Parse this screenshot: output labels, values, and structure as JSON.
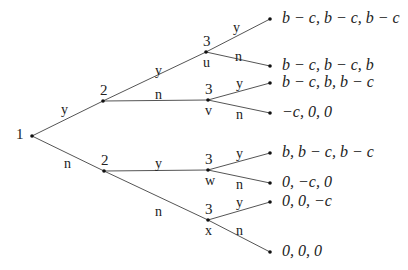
{
  "diagram": {
    "type": "game-tree",
    "colors": {
      "line": "#555555",
      "node": "#111111",
      "text": "#222222"
    },
    "nodes": [
      {
        "id": "root",
        "player": "1",
        "x": 32,
        "y": 136
      },
      {
        "id": "p2-top",
        "player": "2",
        "x": 103,
        "y": 101
      },
      {
        "id": "p2-bot",
        "player": "2",
        "x": 104,
        "y": 171
      },
      {
        "id": "u",
        "player": "3",
        "label": "u",
        "x": 206,
        "y": 52
      },
      {
        "id": "v",
        "player": "3",
        "label": "v",
        "x": 208,
        "y": 100
      },
      {
        "id": "w",
        "player": "3",
        "label": "w",
        "x": 208,
        "y": 170
      },
      {
        "id": "x",
        "player": "3",
        "label": "x",
        "x": 208,
        "y": 220
      }
    ],
    "leaves": [
      {
        "x": 270,
        "y": 19,
        "payoff": "b − c, b − c, b − c"
      },
      {
        "x": 270,
        "y": 66,
        "payoff": "b − c, b − c, b"
      },
      {
        "x": 270,
        "y": 83,
        "payoff": "b − c, b, b − c"
      },
      {
        "x": 270,
        "y": 113,
        "payoff": "−c, 0, 0"
      },
      {
        "x": 270,
        "y": 153,
        "payoff": "b, b − c, b − c"
      },
      {
        "x": 270,
        "y": 183,
        "payoff": "0, −c, 0"
      },
      {
        "x": 270,
        "y": 202,
        "payoff": "0, 0, −c"
      },
      {
        "x": 270,
        "y": 252,
        "payoff": "0, 0, 0"
      }
    ],
    "edges": [
      {
        "from": [
          32,
          136
        ],
        "to": [
          103,
          101
        ],
        "action": "y",
        "lx": 61,
        "ly": 103
      },
      {
        "from": [
          32,
          136
        ],
        "to": [
          104,
          171
        ],
        "action": "n",
        "lx": 64,
        "ly": 157
      },
      {
        "from": [
          103,
          101
        ],
        "to": [
          206,
          52
        ],
        "action": "y",
        "lx": 155,
        "ly": 64
      },
      {
        "from": [
          103,
          101
        ],
        "to": [
          208,
          100
        ],
        "action": "n",
        "lx": 155,
        "ly": 88
      },
      {
        "from": [
          104,
          171
        ],
        "to": [
          208,
          170
        ],
        "action": "y",
        "lx": 155,
        "ly": 157
      },
      {
        "from": [
          104,
          171
        ],
        "to": [
          208,
          220
        ],
        "action": "n",
        "lx": 155,
        "ly": 205
      },
      {
        "from": [
          206,
          52
        ],
        "to": [
          270,
          19
        ],
        "action": "y",
        "lx": 233,
        "ly": 21
      },
      {
        "from": [
          206,
          52
        ],
        "to": [
          270,
          66
        ],
        "action": "n",
        "lx": 235,
        "ly": 50
      },
      {
        "from": [
          208,
          100
        ],
        "to": [
          270,
          83
        ],
        "action": "y",
        "lx": 236,
        "ly": 77
      },
      {
        "from": [
          208,
          100
        ],
        "to": [
          270,
          113
        ],
        "action": "n",
        "lx": 236,
        "ly": 108
      },
      {
        "from": [
          208,
          170
        ],
        "to": [
          270,
          153
        ],
        "action": "y",
        "lx": 236,
        "ly": 147
      },
      {
        "from": [
          208,
          170
        ],
        "to": [
          270,
          183
        ],
        "action": "n",
        "lx": 236,
        "ly": 178
      },
      {
        "from": [
          208,
          220
        ],
        "to": [
          270,
          202
        ],
        "action": "y",
        "lx": 236,
        "ly": 196
      },
      {
        "from": [
          208,
          220
        ],
        "to": [
          270,
          252
        ],
        "action": "n",
        "lx": 236,
        "ly": 224
      }
    ]
  }
}
